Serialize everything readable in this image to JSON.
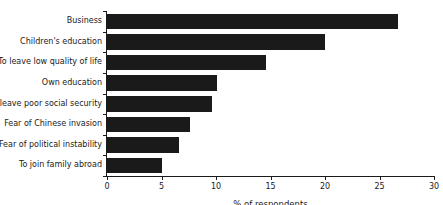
{
  "chart_data": {
    "type": "bar",
    "orientation": "horizontal",
    "title": "",
    "xlabel": "% of respondents",
    "ylabel": "",
    "categories": [
      "Business",
      "Children's education",
      "To leave low quality of life",
      "Own education",
      "To leave poor social security",
      "Fear of Chinese invasion",
      "Fear of political instability",
      "To join family abroad"
    ],
    "values": [
      26.7,
      20.0,
      14.6,
      10.1,
      9.6,
      7.6,
      6.6,
      5.0
    ],
    "xlim": [
      0,
      30
    ],
    "xticks": [
      0,
      5,
      10,
      15,
      20,
      25,
      30
    ],
    "xtick_labels": [
      "0",
      "5",
      "10",
      "15",
      "20",
      "25",
      "30"
    ],
    "grid": false,
    "legend": false,
    "bar_color": "#1a1a1a",
    "axis_color": "#1a1a1a"
  }
}
